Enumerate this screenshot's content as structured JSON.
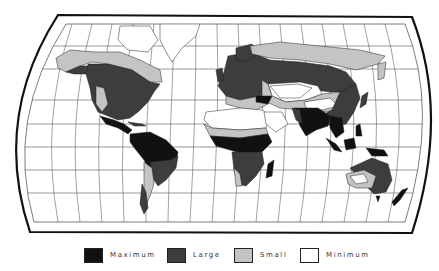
{
  "map": {
    "type": "world-map",
    "projection": "pseudo-cylindrical (truncated, curved sides)",
    "shading_levels": 4,
    "colors": {
      "maximum": "#111111",
      "large": "#3d3d3d",
      "small": "#c4c4c4",
      "minimum": "#ffffff",
      "frame": "#111111",
      "graticule": "#555555"
    },
    "regions": [
      {
        "name": "North America",
        "dominant": "Large"
      },
      {
        "name": "Canada / Alaska north",
        "dominant": "Small"
      },
      {
        "name": "Central America",
        "dominant": "Maximum"
      },
      {
        "name": "South America",
        "dominant": "Maximum"
      },
      {
        "name": "Europe",
        "dominant": "Large"
      },
      {
        "name": "Siberia",
        "dominant": "Small"
      },
      {
        "name": "Central Asia",
        "dominant": "Minimum"
      },
      {
        "name": "Sahara",
        "dominant": "Minimum"
      },
      {
        "name": "Central Africa",
        "dominant": "Maximum"
      },
      {
        "name": "South Asia",
        "dominant": "Maximum"
      },
      {
        "name": "Southeast Asia",
        "dominant": "Maximum"
      },
      {
        "name": "Australia",
        "dominant": "Small"
      }
    ]
  },
  "legend": {
    "items": [
      {
        "label": "Maximum",
        "color": "#111111"
      },
      {
        "label": "Large",
        "color": "#3d3d3d"
      },
      {
        "label": "Small",
        "color": "#c4c4c4"
      },
      {
        "label": "Minimum",
        "color": "#ffffff"
      }
    ]
  }
}
